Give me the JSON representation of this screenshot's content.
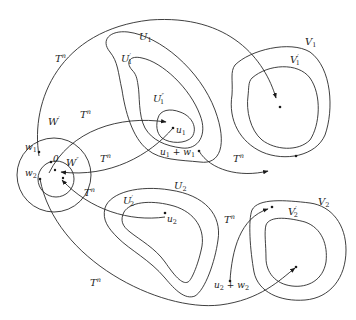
{
  "diagram": {
    "type": "set-mapping-diagram",
    "map_label": "T^n",
    "regions": [
      {
        "id": "U1",
        "label": "U",
        "sub": "1",
        "prime": ""
      },
      {
        "id": "U1p",
        "label": "U",
        "sub": "1",
        "prime": "′"
      },
      {
        "id": "U1pp",
        "label": "U",
        "sub": "1",
        "prime": "″"
      },
      {
        "id": "V1",
        "label": "V",
        "sub": "1",
        "prime": ""
      },
      {
        "id": "V1p",
        "label": "V",
        "sub": "1",
        "prime": "′"
      },
      {
        "id": "U2",
        "label": "U",
        "sub": "2",
        "prime": ""
      },
      {
        "id": "U2p",
        "label": "U",
        "sub": "2",
        "prime": "′"
      },
      {
        "id": "V2",
        "label": "V",
        "sub": "2",
        "prime": ""
      },
      {
        "id": "V2p",
        "label": "V",
        "sub": "2",
        "prime": "′"
      },
      {
        "id": "Wp",
        "label": "W",
        "sub": "",
        "prime": "′"
      },
      {
        "id": "Wpp",
        "label": "W",
        "sub": "",
        "prime": "″"
      }
    ],
    "points": [
      {
        "id": "w1",
        "label": "w",
        "sub": "1"
      },
      {
        "id": "w2",
        "label": "w",
        "sub": "2"
      },
      {
        "id": "zero",
        "label": "0",
        "sub": ""
      },
      {
        "id": "u1",
        "label": "u",
        "sub": "1"
      },
      {
        "id": "u2",
        "label": "u",
        "sub": "2"
      },
      {
        "id": "u1w1",
        "label": "u",
        "sub": "1",
        "suffix": " + w",
        "suffix_sub": "1"
      },
      {
        "id": "u2w2",
        "label": "u",
        "sub": "2",
        "suffix": " + w",
        "suffix_sub": "2"
      }
    ],
    "arrows": [
      {
        "from": "w1",
        "to": "V1'",
        "label": "T^n"
      },
      {
        "from": "W''",
        "to": "U1''",
        "label": "T^n"
      },
      {
        "from": "u1",
        "to": "W''",
        "label": "T^n"
      },
      {
        "from": "u1 + w1",
        "to": "V2'",
        "label": "T^n"
      },
      {
        "from": "u2",
        "to": "W''",
        "label": "T^n"
      },
      {
        "from": "u2 + w2",
        "to": "V2'",
        "label": "T^n"
      },
      {
        "from": "w2",
        "to": "V2'",
        "label": "T^n"
      }
    ],
    "T": "T",
    "n": "n"
  }
}
